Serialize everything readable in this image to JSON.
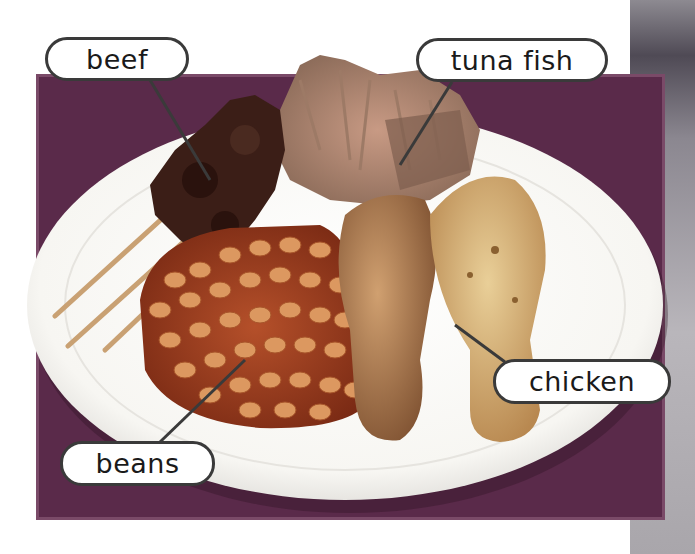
{
  "image": {
    "description": "Photo of a white plate with food items on a dark background panel, with labeled callouts",
    "colors": {
      "panel": "#5a2a4a",
      "plate": "#fbfbf8",
      "label_border": "#3a3a3a",
      "beef": "#3b1e17",
      "tuna": "#b98c78",
      "beans": "#d88a4f",
      "bean_sauce": "#9a3a1e",
      "chicken": "#d9b47a",
      "skewer": "#c9a173"
    }
  },
  "labels": {
    "beef": "beef",
    "tuna": "tuna fish",
    "chicken": "chicken",
    "beans": "beans"
  }
}
